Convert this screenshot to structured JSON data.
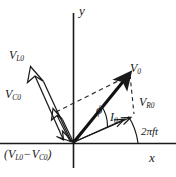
{
  "figure": {
    "type": "phasor-diagram",
    "width": 176,
    "height": 177,
    "background_color": "#ffffff",
    "stroke_color": "#1a1a1a"
  },
  "axes": {
    "x_label": "x",
    "y_label": "y",
    "origin": {
      "x": 73,
      "y": 143
    },
    "x_axis": {
      "x1": 0,
      "y1": 143,
      "x2": 176,
      "y2": 143
    },
    "y_axis": {
      "x1": 73,
      "y1": 14,
      "x2": 73,
      "y2": 167
    }
  },
  "labels": {
    "v_l0": {
      "base": "V",
      "sub": "L0"
    },
    "v_c0": {
      "base": "V",
      "sub": "C0"
    },
    "v_0": {
      "base": "V",
      "sub": "0"
    },
    "v_r0": {
      "base": "V",
      "sub": "R0"
    },
    "i_0": {
      "base": "I",
      "sub": "0"
    },
    "phi": "ϕ",
    "frequency": "2πft",
    "resultant_open": "(",
    "resultant_v_l0": {
      "base": "V",
      "sub": "L0"
    },
    "resultant_minus": "−",
    "resultant_v_c0": {
      "base": "V",
      "sub": "C0"
    },
    "resultant_close": ")"
  },
  "vectors": {
    "v_l0": {
      "name": "V_L0",
      "description": "inductor voltage phasor, points up-left",
      "from": {
        "x": 73,
        "y": 143
      },
      "to": {
        "x": 31,
        "y": 68
      },
      "style": "double-headed-outline"
    },
    "v_c0": {
      "name": "V_C0",
      "description": "capacitor voltage phasor, points down-right (antiparallel to V_L0)",
      "from": {
        "x": 31,
        "y": 68
      },
      "to": {
        "x": 73,
        "y": 143
      },
      "style": "double-headed-outline"
    },
    "v_resultant": {
      "name": "V_L0 - V_C0",
      "description": "short resultant reactive voltage arrow near origin, up-left",
      "from": {
        "x": 73,
        "y": 143
      },
      "to": {
        "x": 54,
        "y": 110
      },
      "style": "outline-arrow"
    },
    "v_0": {
      "name": "V_0",
      "description": "total voltage phasor, solid bold arrow up-right",
      "from": {
        "x": 73,
        "y": 143
      },
      "to": {
        "x": 130,
        "y": 73
      },
      "style": "solid-bold-arrow"
    },
    "i_0": {
      "name": "I_0",
      "description": "current phasor, thin arrow along V_R0 direction",
      "from": {
        "x": 73,
        "y": 143
      },
      "to": {
        "x": 128,
        "y": 118
      },
      "style": "thin-arrow"
    },
    "v_r0": {
      "name": "V_R0",
      "description": "resistor voltage phasor, in phase with current",
      "from": {
        "x": 73,
        "y": 143
      },
      "to": {
        "x": 134,
        "y": 116
      },
      "style": "thin-arrow"
    }
  },
  "dashed_lines": [
    {
      "name": "parallelogram-left",
      "description": "from resultant reactive arrow tip to V_0 tip",
      "from": {
        "x": 54,
        "y": 110
      },
      "to": {
        "x": 130,
        "y": 73
      }
    },
    {
      "name": "parallelogram-right",
      "description": "from V_0 tip down to V_R0 tip",
      "from": {
        "x": 130,
        "y": 73
      },
      "to": {
        "x": 134,
        "y": 116
      }
    }
  ],
  "angles": {
    "phi": {
      "label": "ϕ",
      "description": "phase angle between V_0 and I_0",
      "vertex": {
        "x": 73,
        "y": 143
      }
    },
    "omega_t": {
      "label": "2πft",
      "description": "arc from x-axis to V_R0 / I_0 direction indicating rotation",
      "vertex": {
        "x": 73,
        "y": 143
      }
    }
  },
  "label_positions": {
    "v_l0": {
      "x": 9,
      "y": 49
    },
    "v_c0": {
      "x": 5,
      "y": 88
    },
    "v_0": {
      "x": 130,
      "y": 62
    },
    "v_r0": {
      "x": 140,
      "y": 96
    },
    "i_0": {
      "x": 110,
      "y": 112
    },
    "phi": {
      "x": 95,
      "y": 107
    },
    "freq": {
      "x": 141,
      "y": 126
    },
    "res": {
      "x": 4,
      "y": 148
    },
    "x_axis": {
      "x": 149,
      "y": 152
    },
    "y_axis": {
      "x": 79,
      "y": 4
    }
  }
}
